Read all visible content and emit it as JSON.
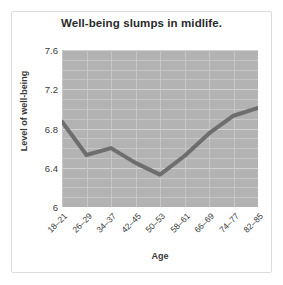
{
  "figure": {
    "title": "Well-being slumps in midlife.",
    "background_color": "#ffffff",
    "frame_color": "#dcdcdc",
    "plot_background_color": "#b3b3b3",
    "line_color": "#6e6e6e",
    "grid_color": "#c6c6c6"
  },
  "chart_data": {
    "type": "line",
    "title": "Well-being slumps in midlife.",
    "xlabel": "Age",
    "ylabel": "Level of well-being",
    "categories": [
      "18–21",
      "26–29",
      "34–37",
      "42–45",
      "50–53",
      "58–61",
      "66–69",
      "74–77",
      "82–85"
    ],
    "values": [
      6.87,
      6.53,
      6.6,
      6.45,
      6.33,
      6.52,
      6.75,
      6.93,
      7.01
    ],
    "series": [
      {
        "name": "Level of well-being",
        "values": [
          6.87,
          6.53,
          6.6,
          6.45,
          6.33,
          6.52,
          6.75,
          6.93,
          7.01
        ]
      }
    ],
    "ylim": [
      6,
      7.6
    ],
    "yticks": [
      6,
      6.4,
      6.8,
      7.2,
      7.6
    ],
    "ytick_labels": [
      "6",
      "6.4",
      "6.8",
      "7.2",
      "7.6"
    ],
    "xtick_labels": [
      "18–21",
      "26–29",
      "34–37",
      "42–45",
      "50–53",
      "58–61",
      "66–69",
      "74–77",
      "82–85"
    ],
    "grid": true,
    "legend": false,
    "legend_position": "none"
  }
}
